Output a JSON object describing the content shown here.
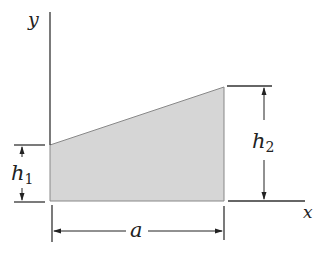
{
  "diagram": {
    "type": "trapezoidal area (figure)",
    "axes": {
      "y_label": "y",
      "x_label": "x"
    },
    "dimensions": {
      "h1": {
        "symbol": "h",
        "subscript": "1"
      },
      "h2": {
        "symbol": "h",
        "subscript": "2"
      },
      "a": {
        "symbol": "a"
      }
    },
    "colors": {
      "fill": "#d6d6d6",
      "line": "#333333"
    }
  }
}
